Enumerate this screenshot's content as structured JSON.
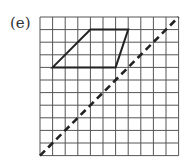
{
  "figure": {
    "label": "(e)",
    "grid": {
      "columns": 11,
      "rows": 11,
      "origin_px": [
        40,
        17
      ],
      "cell_px": 12.6,
      "line_color": "#555555"
    },
    "shape": {
      "type": "parallelogram",
      "vertices_grid": [
        [
          4,
          1
        ],
        [
          7,
          1
        ],
        [
          6,
          4
        ],
        [
          1,
          4
        ]
      ],
      "stroke_color": "#222222"
    },
    "mirror_line": {
      "style": "dashed",
      "from_grid": [
        0,
        11
      ],
      "to_grid": [
        11,
        0
      ],
      "stroke_color": "#222222"
    }
  }
}
